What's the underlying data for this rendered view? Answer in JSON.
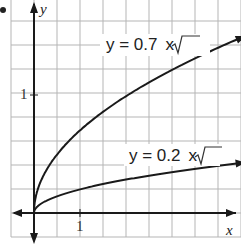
{
  "chart_data": {
    "type": "line",
    "title": "",
    "xlabel": "x",
    "ylabel": "y",
    "xlim": [
      -0.5,
      4.5
    ],
    "ylim": [
      -0.3,
      1.8
    ],
    "grid": true,
    "x_tick_labels": [
      {
        "value": 1,
        "label": "1"
      }
    ],
    "y_tick_labels": [
      {
        "value": 1,
        "label": "1"
      }
    ],
    "series": [
      {
        "name": "y = 0.7√x",
        "function": "0.7*sqrt(x)",
        "x": [
          0,
          0.25,
          0.5,
          1,
          1.5,
          2,
          2.5,
          3,
          3.5,
          4,
          4.5
        ],
        "values": [
          0,
          0.35,
          0.49,
          0.7,
          0.86,
          0.99,
          1.11,
          1.21,
          1.31,
          1.4,
          1.48
        ]
      },
      {
        "name": "y = 0.2√x",
        "function": "0.2*sqrt(x)",
        "x": [
          0,
          0.25,
          0.5,
          1,
          1.5,
          2,
          2.5,
          3,
          3.5,
          4,
          4.5
        ],
        "values": [
          0,
          0.1,
          0.14,
          0.2,
          0.24,
          0.28,
          0.32,
          0.35,
          0.37,
          0.4,
          0.42
        ]
      }
    ],
    "annotations": [
      {
        "text": "y = 0.7√x",
        "near": "upper curve"
      },
      {
        "text": "y = 0.2√x",
        "near": "lower curve"
      }
    ]
  },
  "labels": {
    "x_axis": "x",
    "y_axis": "y",
    "x_tick_1": "1",
    "y_tick_1": "1",
    "eq_upper_lhs": "y = 0.7",
    "eq_upper_rad": "x",
    "eq_lower_lhs": "y = 0.2",
    "eq_lower_rad": "x"
  }
}
